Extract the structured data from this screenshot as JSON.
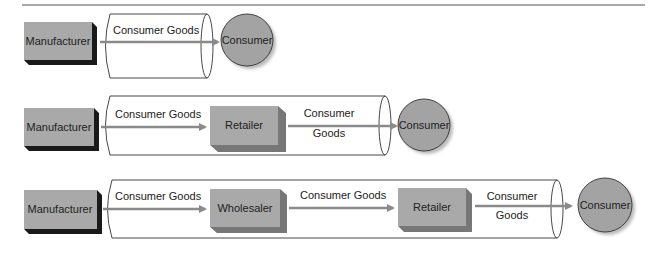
{
  "colors": {
    "box_fill": "#a9a9a9",
    "box_shadow": "#1a1a1a",
    "circle_fill": "#a3a3a3",
    "arrow": "#8a8a8a",
    "outline": "#333333",
    "rule": "#555555"
  },
  "rows": [
    {
      "name": "direct-channel",
      "manufacturer": "Manufacturer",
      "flows": [
        {
          "label": "Consumer Goods"
        }
      ],
      "consumer": "Consumer"
    },
    {
      "name": "retailer-channel",
      "manufacturer": "Manufacturer",
      "intermediaries": [
        "Retailer"
      ],
      "flows": [
        {
          "label": "Consumer Goods"
        },
        {
          "label_line1": "Consumer",
          "label_line2": "Goods"
        }
      ],
      "consumer": "Consumer"
    },
    {
      "name": "wholesaler-retailer-channel",
      "manufacturer": "Manufacturer",
      "intermediaries": [
        "Wholesaler",
        "Retailer"
      ],
      "flows": [
        {
          "label": "Consumer Goods"
        },
        {
          "label": "Consumer Goods"
        },
        {
          "label_line1": "Consumer",
          "label_line2": "Goods"
        }
      ],
      "consumer": "Consumer"
    }
  ]
}
